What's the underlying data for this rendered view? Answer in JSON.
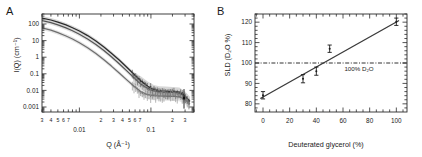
{
  "figure": {
    "panels": [
      {
        "label": "A",
        "chart_data": {
          "type": "line",
          "title": "",
          "xlabel": "Q (Å⁻¹)",
          "ylabel": "I(Q) (cm⁻¹)",
          "xscale": "log",
          "yscale": "log",
          "xlim": [
            0.003,
            0.4
          ],
          "ylim": [
            0.0005,
            400
          ],
          "grid": false,
          "legend": "none",
          "xticks_major": [
            "0.01",
            "0.1"
          ],
          "xticks_minor": [
            "3",
            "4",
            "5",
            "6",
            "7",
            "2",
            "3",
            "4",
            "5",
            "6",
            "7",
            "2",
            "3",
            "4"
          ],
          "yticks": [
            "0.001",
            "0.01",
            "0.1",
            "1",
            "10",
            "100"
          ],
          "series": [
            {
              "name": "curve-1-top",
              "color": "#2a2a2a",
              "band_color": "#c9c9c9",
              "x": [
                0.003,
                0.004,
                0.005,
                0.0065,
                0.008,
                0.01,
                0.013,
                0.017,
                0.022,
                0.028,
                0.036,
                0.046,
                0.058,
                0.072,
                0.09,
                0.11,
                0.13,
                0.16,
                0.2,
                0.25,
                0.3,
                0.35
              ],
              "y": [
                230,
                175,
                130,
                88,
                60,
                38,
                20,
                9.5,
                4.2,
                1.75,
                0.68,
                0.25,
                0.095,
                0.038,
                0.018,
                0.011,
                0.0095,
                0.009,
                0.0085,
                0.008,
                0.0045,
                0.0022
              ]
            },
            {
              "name": "curve-2-middle",
              "color": "#555555",
              "band_color": "#d5d5d5",
              "x": [
                0.003,
                0.004,
                0.005,
                0.0065,
                0.008,
                0.01,
                0.013,
                0.017,
                0.022,
                0.028,
                0.036,
                0.046,
                0.058,
                0.072,
                0.09,
                0.11,
                0.13,
                0.16,
                0.2,
                0.25,
                0.3,
                0.35
              ],
              "y": [
                160,
                120,
                88,
                58,
                39,
                24,
                12.5,
                5.8,
                2.5,
                1.05,
                0.4,
                0.15,
                0.058,
                0.024,
                0.013,
                0.0095,
                0.0085,
                0.008,
                0.0075,
                0.007,
                0.004,
                0.002
              ]
            },
            {
              "name": "curve-3-bottom",
              "color": "#6e6e6e",
              "band_color": "#dcdcdc",
              "x": [
                0.003,
                0.004,
                0.005,
                0.0065,
                0.008,
                0.01,
                0.013,
                0.017,
                0.022,
                0.028,
                0.036,
                0.046,
                0.058,
                0.072,
                0.09,
                0.11,
                0.13,
                0.16,
                0.2,
                0.25,
                0.3,
                0.35
              ],
              "y": [
                58,
                42,
                30,
                19,
                12.5,
                7.4,
                3.7,
                1.65,
                0.7,
                0.29,
                0.112,
                0.043,
                0.018,
                0.0085,
                0.0055,
                0.0048,
                0.0046,
                0.0045,
                0.0044,
                0.0042,
                0.0028,
                0.0015
              ]
            }
          ]
        }
      },
      {
        "label": "B",
        "chart_data": {
          "type": "scatter",
          "title": "",
          "xlabel": "Deuterated glycerol (%)",
          "ylabel": "SLD (D₂O %)",
          "xscale": "linear",
          "yscale": "linear",
          "xlim": [
            -6,
            108
          ],
          "ylim": [
            76,
            124
          ],
          "grid": false,
          "legend": "none",
          "xticks": [
            "0",
            "20",
            "40",
            "60",
            "80",
            "100"
          ],
          "yticks": [
            "80",
            "90",
            "100",
            "110",
            "120"
          ],
          "points": [
            {
              "x": 0,
              "y": 84.2,
              "yerr": 1.8
            },
            {
              "x": 30,
              "y": 92.3,
              "yerr": 2.0
            },
            {
              "x": 40,
              "y": 96.0,
              "yerr": 2.0
            },
            {
              "x": 50,
              "y": 107.0,
              "yerr": 1.8
            },
            {
              "x": 100,
              "y": 120.2,
              "yerr": 1.8
            }
          ],
          "fit_line": {
            "name": "linear-fit",
            "x0": -2,
            "y0": 82.6,
            "x1": 102,
            "y1": 120.8,
            "color": "#3a3a3a"
          },
          "reference_line": {
            "name": "reference-100-d2o",
            "y": 100,
            "style": "dash-dot",
            "color": "#1a1a1a"
          },
          "annotations": [
            {
              "name": "reference-label",
              "text": "100% D₂O",
              "x": 72,
              "y": 96
            }
          ]
        }
      }
    ]
  }
}
